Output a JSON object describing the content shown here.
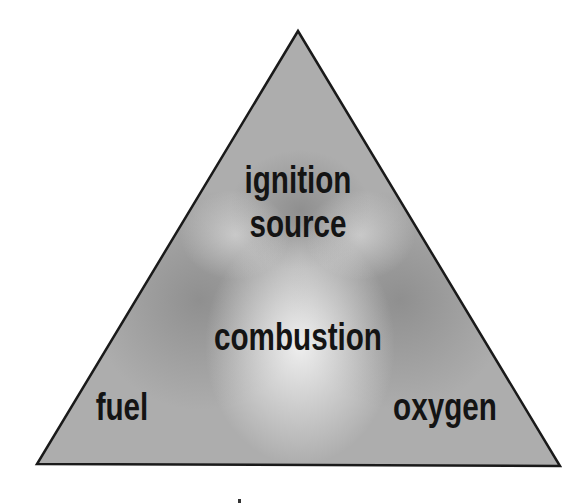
{
  "diagram": {
    "labels": {
      "top": [
        "ignition",
        "source"
      ],
      "center": "combustion",
      "left": "fuel",
      "right": "oxygen"
    },
    "colors": {
      "fill_base": "#a9a9a9",
      "fill_light": "#e4e4e4",
      "fill_dark": "#8a8a8a",
      "outline": "#1a1a1a",
      "text": "#141414"
    }
  }
}
